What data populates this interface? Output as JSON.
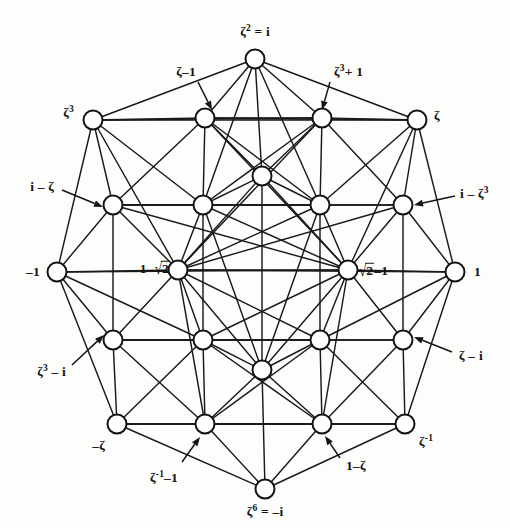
{
  "figure": {
    "background_color": "#fdfdfc",
    "ink_color": "#121212",
    "node_fill": "#ffffff"
  },
  "labels": {
    "top": "ζ² = i",
    "top_left_inner": "ζ−1",
    "top_right_inner": "ζ³+ 1",
    "upper_left": "ζ³",
    "upper_right": "ζ",
    "mid_upper_left": "i−ζ",
    "mid_upper_right": "i−ζ³",
    "left": "−1",
    "right": "1",
    "inner_left": "1−√2",
    "inner_right": "√2−1",
    "mid_lower_left": "ζ³−i",
    "mid_lower_right": "ζ−i",
    "lower_left": "−ζ",
    "lower_right": "ζ⁻¹",
    "bottom_left_inner": "ζ⁻¹−1",
    "bottom_right_inner": "1−ζ",
    "bottom": "ζ⁶ = −i"
  },
  "label_parts": {
    "top": {
      "base": "ζ",
      "sup": "2",
      "tail": " = i"
    },
    "top_left_inner": {
      "base": "ζ",
      "sup": "",
      "tail": "–1"
    },
    "top_right_inner": {
      "base": "ζ",
      "sup": "3",
      "tail": "+ 1"
    },
    "upper_left": {
      "base": "ζ",
      "sup": "3",
      "tail": ""
    },
    "upper_right": {
      "base": "ζ",
      "sup": "",
      "tail": ""
    },
    "mid_upper_left": {
      "base": "i – ζ",
      "sup": "",
      "tail": ""
    },
    "mid_upper_right": {
      "base": "i – ζ",
      "sup": "3",
      "tail": ""
    },
    "left": {
      "base": "–1",
      "sup": "",
      "tail": ""
    },
    "right": {
      "base": "1",
      "sup": "",
      "tail": ""
    },
    "mid_lower_left": {
      "base": "ζ",
      "sup": "3",
      "tail": " – i"
    },
    "mid_lower_right": {
      "base": "ζ – i",
      "sup": "",
      "tail": ""
    },
    "lower_left": {
      "base": "–ζ",
      "sup": "",
      "tail": ""
    },
    "lower_right": {
      "base": "ζ",
      "sup": "-1",
      "tail": ""
    },
    "bottom_left_inner": {
      "base": "ζ",
      "sup": "-1",
      "tail": "–1"
    },
    "bottom_right_inner": {
      "base": "1–ζ",
      "sup": "",
      "tail": ""
    },
    "bottom": {
      "base": "ζ",
      "sup": "6",
      "tail": " = –i"
    }
  },
  "nodes": [
    {
      "id": "top",
      "x": 255,
      "y": 59,
      "label_key": "top"
    },
    {
      "id": "ul",
      "x": 93,
      "y": 120,
      "label_key": "upper_left"
    },
    {
      "id": "ur",
      "x": 417,
      "y": 120,
      "label_key": "upper_right"
    },
    {
      "id": "ml",
      "x": 57,
      "y": 272,
      "label_key": "left"
    },
    {
      "id": "mr",
      "x": 455,
      "y": 272,
      "label_key": "right"
    },
    {
      "id": "ll",
      "x": 117,
      "y": 424,
      "label_key": "lower_left"
    },
    {
      "id": "lr",
      "x": 405,
      "y": 424,
      "label_key": "lower_right"
    },
    {
      "id": "bot",
      "x": 265,
      "y": 489,
      "label_key": "bottom"
    },
    {
      "id": "g00",
      "x": 205,
      "y": 118,
      "label_key": "top_left_inner"
    },
    {
      "id": "g01",
      "x": 322,
      "y": 118,
      "label_key": "top_right_inner"
    },
    {
      "id": "g10",
      "x": 113,
      "y": 205,
      "label_key": "mid_upper_left"
    },
    {
      "id": "g11",
      "x": 203,
      "y": 205,
      "label_key": null
    },
    {
      "id": "g12",
      "x": 320,
      "y": 205,
      "label_key": null
    },
    {
      "id": "g13",
      "x": 403,
      "y": 205,
      "label_key": "mid_upper_right"
    },
    {
      "id": "g20",
      "x": 178,
      "y": 270,
      "label_key": "inner_left"
    },
    {
      "id": "g21",
      "x": 348,
      "y": 270,
      "label_key": "inner_right"
    },
    {
      "id": "g30",
      "x": 113,
      "y": 340,
      "label_key": "mid_lower_left"
    },
    {
      "id": "g31",
      "x": 203,
      "y": 340,
      "label_key": null
    },
    {
      "id": "g32",
      "x": 320,
      "y": 340,
      "label_key": null
    },
    {
      "id": "g33",
      "x": 403,
      "y": 340,
      "label_key": "mid_lower_right"
    },
    {
      "id": "g40",
      "x": 205,
      "y": 424,
      "label_key": "bottom_left_inner"
    },
    {
      "id": "g41",
      "x": 322,
      "y": 424,
      "label_key": "bottom_right_inner"
    },
    {
      "id": "cTop",
      "x": 262,
      "y": 176,
      "label_key": null
    },
    {
      "id": "cBot",
      "x": 262,
      "y": 370,
      "label_key": null
    }
  ],
  "edges": [
    [
      "top",
      "ul"
    ],
    [
      "top",
      "ur"
    ],
    [
      "top",
      "g00"
    ],
    [
      "top",
      "g01"
    ],
    [
      "top",
      "g11"
    ],
    [
      "top",
      "g12"
    ],
    [
      "top",
      "cTop"
    ],
    [
      "ul",
      "ur"
    ],
    [
      "ul",
      "g00"
    ],
    [
      "ul",
      "g10"
    ],
    [
      "ul",
      "g11"
    ],
    [
      "ul",
      "g20"
    ],
    [
      "ul",
      "ml"
    ],
    [
      "ul",
      "g01"
    ],
    [
      "ur",
      "g01"
    ],
    [
      "ur",
      "g13"
    ],
    [
      "ur",
      "g12"
    ],
    [
      "ur",
      "g21"
    ],
    [
      "ur",
      "mr"
    ],
    [
      "ur",
      "g00"
    ],
    [
      "g00",
      "g01"
    ],
    [
      "g00",
      "g10"
    ],
    [
      "g00",
      "g11"
    ],
    [
      "g00",
      "cTop"
    ],
    [
      "g00",
      "g12"
    ],
    [
      "g00",
      "g21"
    ],
    [
      "g01",
      "g13"
    ],
    [
      "g01",
      "g12"
    ],
    [
      "g01",
      "cTop"
    ],
    [
      "g01",
      "g11"
    ],
    [
      "g01",
      "g20"
    ],
    [
      "g10",
      "g11"
    ],
    [
      "g10",
      "g12"
    ],
    [
      "g10",
      "g13"
    ],
    [
      "g10",
      "ml"
    ],
    [
      "g10",
      "g20"
    ],
    [
      "g10",
      "g30"
    ],
    [
      "g10",
      "g21"
    ],
    [
      "g11",
      "g12"
    ],
    [
      "g11",
      "cTop"
    ],
    [
      "g11",
      "g20"
    ],
    [
      "g11",
      "g21"
    ],
    [
      "g11",
      "g31"
    ],
    [
      "g11",
      "cBot"
    ],
    [
      "g12",
      "cTop"
    ],
    [
      "g12",
      "g21"
    ],
    [
      "g12",
      "g20"
    ],
    [
      "g12",
      "g32"
    ],
    [
      "g12",
      "cBot"
    ],
    [
      "g13",
      "mr"
    ],
    [
      "g13",
      "g21"
    ],
    [
      "g13",
      "g33"
    ],
    [
      "g13",
      "g20"
    ],
    [
      "g13",
      "g12"
    ],
    [
      "cTop",
      "g20"
    ],
    [
      "cTop",
      "g21"
    ],
    [
      "cTop",
      "cBot"
    ],
    [
      "ml",
      "g20"
    ],
    [
      "ml",
      "g30"
    ],
    [
      "ml",
      "ll"
    ],
    [
      "ml",
      "g31"
    ],
    [
      "ml",
      "g21"
    ],
    [
      "mr",
      "g21"
    ],
    [
      "mr",
      "g33"
    ],
    [
      "mr",
      "lr"
    ],
    [
      "mr",
      "g32"
    ],
    [
      "mr",
      "g20"
    ],
    [
      "g20",
      "g21"
    ],
    [
      "g20",
      "g30"
    ],
    [
      "g20",
      "g31"
    ],
    [
      "g20",
      "cBot"
    ],
    [
      "g20",
      "g32"
    ],
    [
      "g20",
      "g40"
    ],
    [
      "g21",
      "g33"
    ],
    [
      "g21",
      "g32"
    ],
    [
      "g21",
      "cBot"
    ],
    [
      "g21",
      "g31"
    ],
    [
      "g21",
      "g41"
    ],
    [
      "g30",
      "g31"
    ],
    [
      "g30",
      "g32"
    ],
    [
      "g30",
      "g33"
    ],
    [
      "g30",
      "ll"
    ],
    [
      "g30",
      "g40"
    ],
    [
      "g31",
      "g32"
    ],
    [
      "g31",
      "cBot"
    ],
    [
      "g31",
      "g40"
    ],
    [
      "g31",
      "g41"
    ],
    [
      "g31",
      "ll"
    ],
    [
      "g32",
      "cBot"
    ],
    [
      "g32",
      "g41"
    ],
    [
      "g32",
      "g40"
    ],
    [
      "g32",
      "lr"
    ],
    [
      "g33",
      "lr"
    ],
    [
      "g33",
      "g41"
    ],
    [
      "g33",
      "g32"
    ],
    [
      "cBot",
      "g40"
    ],
    [
      "cBot",
      "g41"
    ],
    [
      "cBot",
      "bot"
    ],
    [
      "ll",
      "lr"
    ],
    [
      "ll",
      "g40"
    ],
    [
      "ll",
      "bot"
    ],
    [
      "ll",
      "g41"
    ],
    [
      "lr",
      "g41"
    ],
    [
      "lr",
      "bot"
    ],
    [
      "lr",
      "g40"
    ],
    [
      "g40",
      "g41"
    ],
    [
      "g40",
      "bot"
    ],
    [
      "g41",
      "bot"
    ]
  ],
  "leaders": [
    {
      "name": "leader-zeta-minus-1",
      "from": [
        198,
        82
      ],
      "to": [
        212,
        110
      ]
    },
    {
      "name": "leader-zeta3-plus-1",
      "from": [
        330,
        82
      ],
      "to": [
        322,
        110
      ]
    },
    {
      "name": "leader-i-minus-zeta",
      "from": [
        62,
        190
      ],
      "to": [
        103,
        207
      ]
    },
    {
      "name": "leader-i-minus-zeta3",
      "from": [
        455,
        196
      ],
      "to": [
        414,
        205
      ]
    },
    {
      "name": "leader-zeta3-minus-i",
      "from": [
        72,
        365
      ],
      "to": [
        104,
        335
      ]
    },
    {
      "name": "leader-zeta-minus-i",
      "from": [
        452,
        352
      ],
      "to": [
        414,
        337
      ]
    },
    {
      "name": "leader-zeta-inv-minus-1",
      "from": [
        182,
        462
      ],
      "to": [
        200,
        437
      ]
    },
    {
      "name": "leader-1-minus-zeta",
      "from": [
        340,
        458
      ],
      "to": [
        325,
        436
      ]
    }
  ],
  "label_positions": {
    "top": {
      "x": 255,
      "y": 32,
      "anchor": "c"
    },
    "top_left_inner": {
      "x": 196,
      "y": 72,
      "anchor": "r"
    },
    "top_right_inner": {
      "x": 334,
      "y": 72,
      "anchor": "l"
    },
    "upper_left": {
      "x": 74,
      "y": 113,
      "anchor": "r"
    },
    "upper_right": {
      "x": 434,
      "y": 116,
      "anchor": "l"
    },
    "mid_upper_left": {
      "x": 54,
      "y": 187,
      "anchor": "r"
    },
    "mid_upper_right": {
      "x": 460,
      "y": 194,
      "anchor": "l"
    },
    "left": {
      "x": 40,
      "y": 272,
      "anchor": "r"
    },
    "right": {
      "x": 474,
      "y": 272,
      "anchor": "l"
    },
    "inner_left": {
      "x": 170,
      "y": 268,
      "anchor": "r"
    },
    "inner_right": {
      "x": 358,
      "y": 270,
      "anchor": "l"
    },
    "mid_lower_left": {
      "x": 66,
      "y": 372,
      "anchor": "r"
    },
    "mid_lower_right": {
      "x": 459,
      "y": 356,
      "anchor": "l"
    },
    "lower_left": {
      "x": 105,
      "y": 446,
      "anchor": "r"
    },
    "lower_right": {
      "x": 419,
      "y": 442,
      "anchor": "l"
    },
    "bottom_left_inner": {
      "x": 178,
      "y": 478,
      "anchor": "r"
    },
    "bottom_right_inner": {
      "x": 346,
      "y": 466,
      "anchor": "l"
    },
    "bottom": {
      "x": 265,
      "y": 512,
      "anchor": "c"
    }
  },
  "geometry": {
    "node_radius": 9.5,
    "edge_stroke_width": 1.45,
    "width": 510,
    "height": 528
  },
  "chart_data": {
    "type": "diagram",
    "node_count": 24,
    "outer_vertex_labels": [
      "ζ² = i",
      "ζ",
      "i−ζ³",
      "1",
      "ζ−i",
      "ζ⁻¹",
      "ζ⁶ = −i",
      "1−ζ",
      "ζ⁻¹−1",
      "−ζ",
      "ζ³−i",
      "−1",
      "i−ζ",
      "ζ³",
      "ζ−1",
      "ζ³+1"
    ],
    "inner_vertex_labels": [
      "1−√2",
      "√2−1"
    ]
  }
}
